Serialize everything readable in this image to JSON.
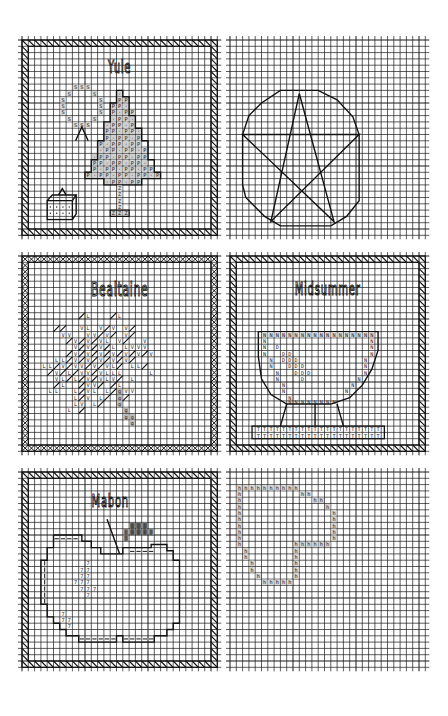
{
  "page": {
    "grid_color": "#1a1a1a",
    "background": "#ffffff",
    "cell_px": 6.3
  },
  "panels": [
    {
      "id": "yule",
      "title": "Yule",
      "border": "diagonal-hatch",
      "col": 0,
      "row": 0,
      "motifs": [
        "wreath (S)",
        "candle/stand",
        "gift box",
        "pine tree (P)",
        "trunk (Z)"
      ],
      "symbols": {
        "wreath": "S",
        "tree": "P",
        "trunk": "Z"
      }
    },
    {
      "id": "pentacle",
      "title": "",
      "border": "none",
      "col": 1,
      "row": 0,
      "motifs": [
        "octagon outline",
        "five-pointed star"
      ]
    },
    {
      "id": "bealtaine",
      "title": "Bealtaine",
      "border": "cross-chain",
      "col": 0,
      "row": 1,
      "motifs": [
        "leafy hawthorn spray"
      ],
      "symbols": {
        "leaf_light": "L",
        "leaf_dark": "V",
        "stem": "g"
      }
    },
    {
      "id": "midsummer",
      "title": "Midsummer",
      "border": "diagonal-hatch",
      "col": 1,
      "row": 1,
      "motifs": [
        "cauldron bowl (N)",
        "flame band (D)",
        "stand base (T)"
      ],
      "symbols": {
        "bowl": "N",
        "inner": "D",
        "base": "T"
      }
    },
    {
      "id": "mabon",
      "title": "Mabon",
      "border": "diagonal-hatch",
      "col": 0,
      "row": 2,
      "motifs": [
        "apple outline",
        "stem",
        "leaf",
        "highlights (7)"
      ],
      "symbols": {
        "highlight": "7"
      }
    },
    {
      "id": "spiral",
      "title": "",
      "border": "none",
      "col": 1,
      "row": 2,
      "motifs": [
        "squared spiral (h)"
      ],
      "symbols": {
        "spiral": "h"
      }
    }
  ]
}
